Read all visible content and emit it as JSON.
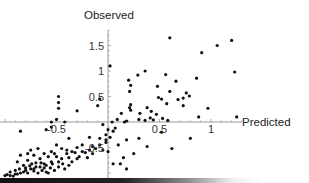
{
  "chart_data": {
    "type": "scatter",
    "title": "",
    "xlabel": "Predicted",
    "ylabel": "Observed",
    "xlim": [
      -1.05,
      1.3
    ],
    "ylim": [
      -1.15,
      1.8
    ],
    "grid": false,
    "legend": "none",
    "x_ticks": [
      {
        "value": -0.5,
        "label": "-0.5"
      },
      {
        "value": 0.5,
        "label": "0.5"
      },
      {
        "value": 1,
        "label": "1"
      }
    ],
    "y_ticks": [
      {
        "value": -0.5,
        "label": "-0.5"
      },
      {
        "value": 0.5,
        "label": "0.5"
      },
      {
        "value": 1,
        "label": "1"
      },
      {
        "value": 1.5,
        "label": "1.5"
      }
    ],
    "x_minor_step": 0.1,
    "y_minor_step": 0.1,
    "series": [
      {
        "name": "observations",
        "color": "#111111",
        "points": [
          [
            0.02,
            1.1
          ],
          [
            0.6,
            1.65
          ],
          [
            1.06,
            1.5
          ],
          [
            1.2,
            1.6
          ],
          [
            0.91,
            1.36
          ],
          [
            1.23,
            0.98
          ],
          [
            0.36,
            1.0
          ],
          [
            0.29,
            0.92
          ],
          [
            0.56,
            0.93
          ],
          [
            0.66,
            0.8
          ],
          [
            0.48,
            0.7
          ],
          [
            0.86,
            0.86
          ],
          [
            0.76,
            0.57
          ],
          [
            0.79,
            0.51
          ],
          [
            0.49,
            0.48
          ],
          [
            0.52,
            0.45
          ],
          [
            0.6,
            0.6
          ],
          [
            0.68,
            0.44
          ],
          [
            0.73,
            0.47
          ],
          [
            0.73,
            0.32
          ],
          [
            0.57,
            0.36
          ],
          [
            0.2,
            0.82
          ],
          [
            0.22,
            0.72
          ],
          [
            0.21,
            0.6
          ],
          [
            0.22,
            0.34
          ],
          [
            0.21,
            0.28
          ],
          [
            0.22,
            0.23
          ],
          [
            0.38,
            0.28
          ],
          [
            0.42,
            0.21
          ],
          [
            0.47,
            0.15
          ],
          [
            0.31,
            0.17
          ],
          [
            0.13,
            0.17
          ],
          [
            0.18,
            0.02
          ],
          [
            0.09,
            0.05
          ],
          [
            0.16,
            0.0
          ],
          [
            0.3,
            0.05
          ],
          [
            0.36,
            0.03
          ],
          [
            0.41,
            0.08
          ],
          [
            0.44,
            0.04
          ],
          [
            0.53,
            0.07
          ],
          [
            0.58,
            0.03
          ],
          [
            0.97,
            0.27
          ],
          [
            0.88,
            0.1
          ],
          [
            1.25,
            0.1
          ],
          [
            0.04,
            0.0
          ],
          [
            -0.08,
            0.45
          ],
          [
            -0.1,
            0.32
          ],
          [
            -0.3,
            0.22
          ],
          [
            -0.48,
            0.5
          ],
          [
            -0.48,
            0.38
          ],
          [
            -0.48,
            0.27
          ],
          [
            -0.5,
            0.05
          ],
          [
            -0.55,
            0.0
          ],
          [
            -0.42,
            0.0
          ],
          [
            -0.85,
            -0.18
          ],
          [
            -0.6,
            -0.15
          ],
          [
            -0.55,
            -0.1
          ],
          [
            -0.38,
            -0.32
          ],
          [
            -0.05,
            -0.05
          ],
          [
            0.0,
            -0.15
          ],
          [
            0.07,
            -0.12
          ],
          [
            0.05,
            -0.18
          ],
          [
            -0.02,
            -0.35
          ],
          [
            -0.08,
            -0.32
          ],
          [
            -0.18,
            -0.3
          ],
          [
            -0.25,
            -0.45
          ],
          [
            -0.3,
            -0.5
          ],
          [
            -0.35,
            -0.58
          ],
          [
            -0.4,
            -0.62
          ],
          [
            -0.45,
            -0.72
          ],
          [
            -0.5,
            -0.68
          ],
          [
            -0.55,
            -0.78
          ],
          [
            -0.6,
            -0.85
          ],
          [
            -0.65,
            -0.8
          ],
          [
            -0.7,
            -0.88
          ],
          [
            -0.75,
            -0.92
          ],
          [
            -0.8,
            -0.95
          ],
          [
            -0.85,
            -1.0
          ],
          [
            -0.9,
            -1.02
          ],
          [
            -0.95,
            -1.05
          ],
          [
            -1.0,
            -1.05
          ],
          [
            -0.98,
            -1.03
          ],
          [
            -0.92,
            -1.06
          ],
          [
            -0.88,
            -1.02
          ],
          [
            -0.82,
            -0.98
          ],
          [
            -0.78,
            -1.0
          ],
          [
            -0.72,
            -0.96
          ],
          [
            -0.68,
            -1.0
          ],
          [
            -0.64,
            -0.95
          ],
          [
            -0.6,
            -0.98
          ],
          [
            -0.7,
            -0.8
          ],
          [
            -0.62,
            -0.9
          ],
          [
            -0.58,
            -1.0
          ],
          [
            -0.52,
            -0.95
          ],
          [
            -0.48,
            -0.88
          ],
          [
            -0.42,
            -0.92
          ],
          [
            -0.38,
            -0.85
          ],
          [
            -0.35,
            -0.78
          ],
          [
            -0.3,
            -0.72
          ],
          [
            -0.28,
            -0.68
          ],
          [
            -0.22,
            -0.6
          ],
          [
            -0.18,
            -0.55
          ],
          [
            -0.15,
            -0.48
          ],
          [
            -0.12,
            -0.52
          ],
          [
            -0.08,
            -0.45
          ],
          [
            -0.05,
            -0.55
          ],
          [
            -0.02,
            -0.4
          ],
          [
            -0.75,
            -0.55
          ],
          [
            -0.78,
            -0.62
          ],
          [
            -0.72,
            -0.65
          ],
          [
            -0.68,
            -0.52
          ],
          [
            -0.62,
            -0.62
          ],
          [
            -0.55,
            -0.58
          ],
          [
            -0.5,
            -0.45
          ],
          [
            -0.45,
            -0.52
          ],
          [
            -0.85,
            -0.65
          ],
          [
            -0.88,
            -0.78
          ],
          [
            -0.82,
            -0.85
          ],
          [
            -0.78,
            -0.75
          ],
          [
            -0.74,
            -0.82
          ],
          [
            -0.66,
            -0.72
          ],
          [
            -0.58,
            -0.68
          ],
          [
            -0.52,
            -0.62
          ],
          [
            -0.4,
            -0.55
          ],
          [
            -0.32,
            -0.6
          ],
          [
            -0.25,
            -0.58
          ],
          [
            -0.2,
            -0.7
          ],
          [
            -0.15,
            -0.62
          ],
          [
            -0.38,
            -0.7
          ],
          [
            -0.44,
            -0.82
          ],
          [
            -0.48,
            -0.78
          ],
          [
            -0.95,
            -0.98
          ],
          [
            -0.9,
            -0.95
          ],
          [
            -0.86,
            -0.92
          ],
          [
            -0.8,
            -0.9
          ],
          [
            -0.76,
            -0.86
          ],
          [
            -0.72,
            -0.92
          ],
          [
            -0.66,
            -0.88
          ],
          [
            -0.62,
            -0.82
          ],
          [
            -0.56,
            -0.9
          ],
          [
            -0.54,
            -0.82
          ],
          [
            0.1,
            -0.45
          ],
          [
            0.18,
            -0.35
          ],
          [
            0.3,
            -0.32
          ],
          [
            0.25,
            -0.62
          ],
          [
            0.15,
            -0.7
          ],
          [
            0.12,
            -0.82
          ],
          [
            0.18,
            -0.92
          ],
          [
            0.05,
            -0.82
          ],
          [
            0.0,
            -0.58
          ],
          [
            0.02,
            -0.3
          ],
          [
            0.38,
            -0.48
          ],
          [
            0.52,
            -0.2
          ],
          [
            0.62,
            -0.52
          ],
          [
            0.8,
            -0.32
          ],
          [
            -0.02,
            -0.25
          ]
        ]
      }
    ]
  }
}
